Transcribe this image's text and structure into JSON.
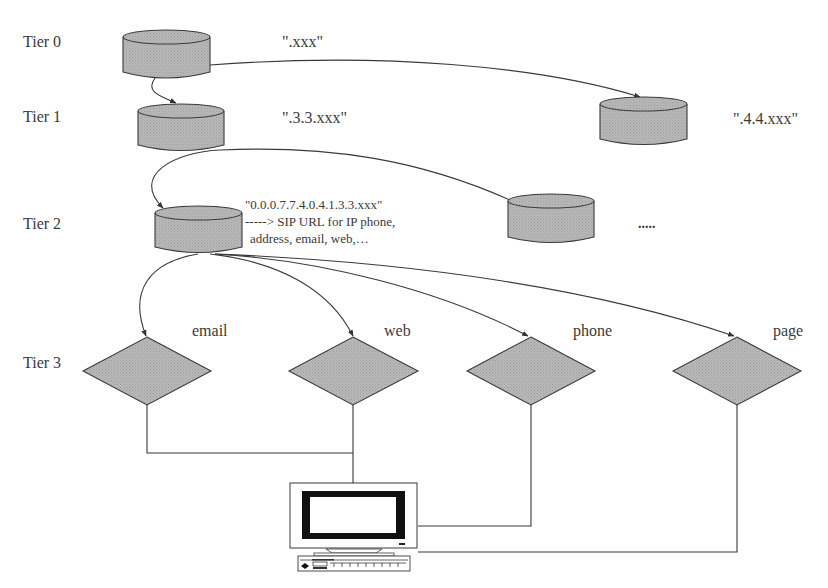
{
  "diagram": {
    "type": "hierarchical ENUM DNS resolution diagram",
    "colors": {
      "node_fill": "#b3b3b3",
      "node_stroke": "#3a3a3a",
      "line": "#3a3a3a",
      "text": "#3a3a3a",
      "background": "#ffffff"
    },
    "tiers": [
      {
        "label": "Tier 0"
      },
      {
        "label": "Tier 1"
      },
      {
        "label": "Tier 2"
      },
      {
        "label": "Tier 3"
      }
    ],
    "nodes": {
      "tier0_root": {
        "shape": "cylinder",
        "label": "\".xxx\""
      },
      "tier1_left": {
        "shape": "cylinder",
        "label": "\".3.3.xxx\""
      },
      "tier1_right": {
        "shape": "cylinder",
        "label": "\".4.4.xxx\""
      },
      "tier2_left": {
        "shape": "cylinder",
        "label_lines": [
          "\"0.0.0.7.7.4.0.4.1.3.3.xxx\"",
          "-----> SIP URL  for IP   phone,",
          "address, email, web,…"
        ]
      },
      "tier2_right": {
        "shape": "cylinder",
        "label": ""
      },
      "tier2_more": {
        "label": "....."
      },
      "tier3": [
        {
          "shape": "diamond",
          "label": "email"
        },
        {
          "shape": "diamond",
          "label": "web"
        },
        {
          "shape": "diamond",
          "label": "phone"
        },
        {
          "shape": "diamond",
          "label": "page"
        }
      ],
      "client": {
        "shape": "computer-icon",
        "label": ""
      }
    },
    "edges": [
      {
        "from": "tier0_root",
        "to": "tier1_left",
        "arrow": true
      },
      {
        "from": "tier0_root",
        "to": "tier1_right",
        "arrow": true
      },
      {
        "from": "tier1_left",
        "to": "tier2_left",
        "arrow": true
      },
      {
        "from": "tier1_left",
        "to": "tier2_right",
        "arrow": false
      },
      {
        "from": "tier2_left",
        "to": "email",
        "arrow": true
      },
      {
        "from": "tier2_left",
        "to": "web",
        "arrow": true
      },
      {
        "from": "tier2_left",
        "to": "phone",
        "arrow": true
      },
      {
        "from": "tier2_left",
        "to": "page",
        "arrow": true
      },
      {
        "from": "email",
        "to": "client",
        "arrow": false
      },
      {
        "from": "web",
        "to": "client",
        "arrow": false
      },
      {
        "from": "phone",
        "to": "client",
        "arrow": false
      },
      {
        "from": "page",
        "to": "client",
        "arrow": false
      }
    ]
  }
}
